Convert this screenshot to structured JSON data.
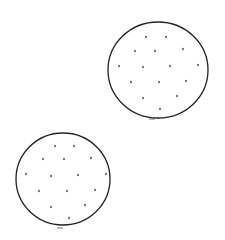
{
  "colors": {
    "background": "#ffffff",
    "ink": "#222222"
  },
  "circles": [
    {
      "cx": 158,
      "cy": 70,
      "rx": 50,
      "ry": 48,
      "dots": [
        [
          146,
          37
        ],
        [
          166,
          37
        ],
        [
          135,
          51
        ],
        [
          155,
          51
        ],
        [
          183,
          49
        ],
        [
          119,
          66
        ],
        [
          143,
          67
        ],
        [
          170,
          66
        ],
        [
          198,
          65
        ],
        [
          131,
          82
        ],
        [
          159,
          82
        ],
        [
          186,
          81
        ],
        [
          143,
          98
        ],
        [
          177,
          96
        ],
        [
          160,
          109
        ]
      ],
      "tick": [
        152,
        119
      ]
    },
    {
      "cx": 63,
      "cy": 179,
      "rx": 47,
      "ry": 46,
      "dots": [
        [
          55,
          146
        ],
        [
          74,
          146
        ],
        [
          43,
          159
        ],
        [
          64,
          159
        ],
        [
          91,
          158
        ],
        [
          26,
          174
        ],
        [
          51,
          176
        ],
        [
          78,
          175
        ],
        [
          106,
          174
        ],
        [
          39,
          191
        ],
        [
          67,
          191
        ],
        [
          95,
          190
        ],
        [
          51,
          207
        ],
        [
          85,
          205
        ],
        [
          69,
          218
        ]
      ],
      "tick": [
        60,
        228
      ]
    }
  ]
}
